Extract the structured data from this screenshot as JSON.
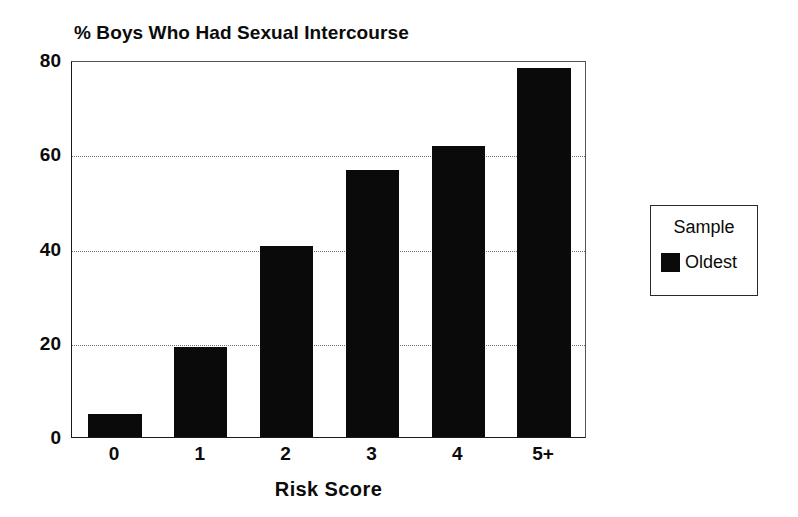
{
  "chart_data": {
    "type": "bar",
    "title": "% Boys Who Had Sexual Intercourse",
    "xlabel": "Risk Score",
    "ylabel": "",
    "categories": [
      "0",
      "1",
      "2",
      "3",
      "4",
      "5+"
    ],
    "values": [
      4.8,
      19.0,
      40.6,
      56.7,
      61.8,
      78.4
    ],
    "series": [
      {
        "name": "Oldest",
        "color": "#0a0a0a",
        "values": [
          4.8,
          19.0,
          40.6,
          56.7,
          61.8,
          78.4
        ]
      }
    ],
    "ylim": [
      0,
      80
    ],
    "yticks": [
      0,
      20,
      40,
      60,
      80
    ],
    "ytick_labels": [
      "0",
      "20",
      "40",
      "60",
      "80"
    ],
    "gridlines": {
      "enabled": true,
      "axis": "y",
      "values": [
        20,
        40,
        60
      ],
      "style": "dotted",
      "color": "#6f6f6f"
    },
    "legend": {
      "position": "right",
      "title": "Sample",
      "entries": [
        {
          "label": "Oldest",
          "color": "#0a0a0a"
        }
      ]
    },
    "bar_color": "#0a0a0a",
    "axis_color": "#1a1a1a",
    "background": "#ffffff"
  }
}
